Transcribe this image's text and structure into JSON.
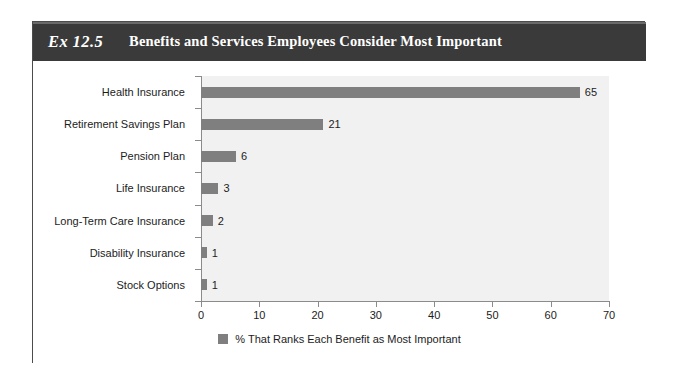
{
  "exhibit": {
    "number_label": "Ex 12.5",
    "title": "Benefits and Services Employees Consider Most Important"
  },
  "colors": {
    "header_band": "#3a3a3a",
    "bar": "#7f7f7f",
    "plot_background": "#f1f1f1",
    "card_border": "#4c4c4c",
    "axis_line": "#8b8b8b",
    "text": "#1c1c1c"
  },
  "chart_data": {
    "type": "bar",
    "orientation": "horizontal",
    "title": "Benefits and Services Employees Consider Most Important",
    "categories": [
      "Health Insurance",
      "Retirement Savings Plan",
      "Pension Plan",
      "Life Insurance",
      "Long-Term Care Insurance",
      "Disability Insurance",
      "Stock Options"
    ],
    "values": [
      65,
      21,
      6,
      3,
      2,
      1,
      1
    ],
    "data_labels": [
      "65",
      "21",
      "6",
      "3",
      "2",
      "1",
      "1"
    ],
    "series": [
      {
        "name": "% That Ranks Each Benefit as Most Important",
        "values": [
          65,
          21,
          6,
          3,
          2,
          1,
          1
        ]
      }
    ],
    "xlabel": "",
    "ylabel": "",
    "xlim": [
      0,
      70
    ],
    "xticks": [
      0,
      10,
      20,
      30,
      40,
      50,
      60,
      70
    ],
    "xtick_labels": [
      "0",
      "10",
      "20",
      "30",
      "40",
      "50",
      "60",
      "70"
    ],
    "grid": false,
    "legend": {
      "position": "bottom",
      "entries": [
        "% That Ranks Each Benefit as Most Important"
      ]
    }
  },
  "legend": {
    "label": "% That Ranks Each Benefit as Most Important"
  }
}
